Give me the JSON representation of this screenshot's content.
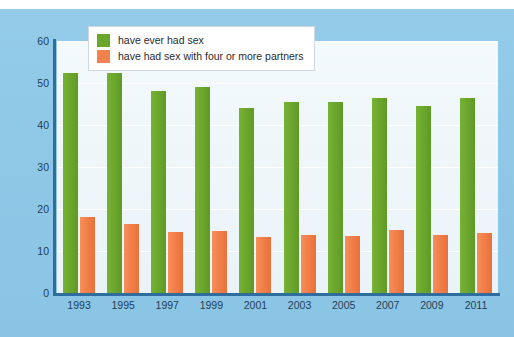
{
  "top_caption": "",
  "legend": {
    "position": "top-left-inside",
    "items": [
      {
        "label": "have ever had sex",
        "color": "#6ba72d",
        "swatch": "green-swatch"
      },
      {
        "label": "have had sex with four or more partners",
        "color": "#f2814d",
        "swatch": "orange-swatch"
      }
    ]
  },
  "colors": {
    "card_background": "#8ec7e6",
    "plot_background": "#eef6fa",
    "axis": "#2f6d9e",
    "gridline": "#ffffff",
    "series_green": "#6ba72d",
    "series_orange": "#f2814d",
    "tick_text": "#1d3f57"
  },
  "chart_data": {
    "type": "bar",
    "title": "",
    "subtitle": "",
    "xlabel": "",
    "ylabel": "",
    "categories": [
      "1993",
      "1995",
      "1997",
      "1999",
      "2001",
      "2003",
      "2005",
      "2007",
      "2009",
      "2011"
    ],
    "series": [
      {
        "name": "have ever had sex",
        "color": "#6ba72d",
        "values": [
          52.5,
          52.5,
          48.0,
          49.0,
          44.0,
          45.5,
          45.5,
          46.5,
          44.5,
          46.5
        ]
      },
      {
        "name": "have had sex with four or more partners",
        "color": "#f2814d",
        "values": [
          18.0,
          16.5,
          14.5,
          14.8,
          13.3,
          13.8,
          13.5,
          15.0,
          13.7,
          14.3
        ]
      }
    ],
    "ylim": [
      0,
      60
    ],
    "yticks": [
      0,
      10,
      20,
      30,
      40,
      50,
      60
    ],
    "ytick_labels": [
      "0",
      "10",
      "20",
      "30",
      "40",
      "50",
      "60"
    ],
    "grid": "horizontal",
    "legend_position": "upper left inside plot"
  }
}
